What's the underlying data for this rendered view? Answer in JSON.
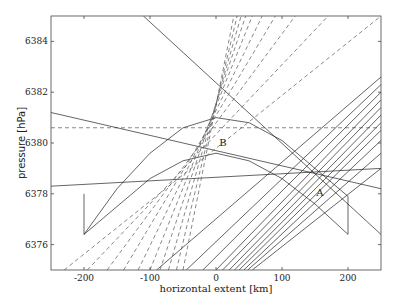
{
  "chart_data": {
    "type": "line",
    "title": "",
    "xlabel": "horizontal extent [km]",
    "ylabel": "pressure [hPa]",
    "xlim": [
      -250,
      250
    ],
    "ylim": [
      6375,
      6385
    ],
    "xticks": [
      -200,
      -100,
      0,
      100,
      200
    ],
    "xtick_labels": [
      "-200",
      "-100",
      "0",
      "100",
      "200"
    ],
    "yticks": [
      6376,
      6378,
      6380,
      6382,
      6384
    ],
    "ytick_labels": [
      "6376",
      "6378",
      "6380",
      "6382",
      "6384"
    ],
    "grid": false,
    "legend": null,
    "annotations": [
      {
        "text": "A",
        "x": 152,
        "y": 6377.9
      },
      {
        "text": "B",
        "x": 5,
        "y": 6379.9
      }
    ],
    "reference_lines": [
      {
        "name": "horizontal-dashed",
        "style": "dashed",
        "y": 6380.6
      }
    ],
    "arcs": [
      {
        "name": "outer-arc",
        "style": "solid",
        "points": [
          [
            -200,
            6378.0
          ],
          [
            -200,
            6376.4
          ],
          [
            -150,
            6378.2
          ],
          [
            -100,
            6379.6
          ],
          [
            -50,
            6380.6
          ],
          [
            0,
            6381.0
          ],
          [
            50,
            6380.8
          ],
          [
            100,
            6380.1
          ],
          [
            150,
            6379.0
          ],
          [
            200,
            6377.9
          ],
          [
            200,
            6376.4
          ]
        ]
      },
      {
        "name": "inner-arc",
        "style": "solid",
        "points": [
          [
            -200,
            6376.4
          ],
          [
            -150,
            6377.5
          ],
          [
            -100,
            6378.6
          ],
          [
            -50,
            6379.3
          ],
          [
            0,
            6379.6
          ],
          [
            50,
            6379.3
          ],
          [
            100,
            6378.6
          ],
          [
            150,
            6377.6
          ],
          [
            200,
            6376.4
          ]
        ]
      }
    ],
    "solid_lines": [
      {
        "name": "steep-descending",
        "p1": [
          -110,
          6385.0
        ],
        "p2": [
          250,
          6376.4
        ]
      },
      {
        "name": "shallow-descending",
        "p1": [
          -250,
          6381.2
        ],
        "p2": [
          250,
          6378.2
        ]
      },
      {
        "name": "near-horizontal",
        "p1": [
          -250,
          6378.3
        ],
        "p2": [
          250,
          6379.0
        ]
      }
    ],
    "series": [
      {
        "name": "rays-through-A",
        "style": "solid",
        "pivot": [
          150,
          6378.9
        ],
        "right_end_y": [
          6382.6,
          6382.3,
          6382.0,
          6381.7,
          6381.4,
          6381.1,
          6380.8,
          6380.5,
          6380.1,
          6379.6,
          6379.0
        ],
        "left_end_x_at_bottom": [
          -90,
          -45,
          -20,
          0,
          10,
          20,
          28,
          35,
          42,
          48,
          55
        ]
      },
      {
        "name": "rays-near-B",
        "style": "dashed",
        "bottom_x": [
          -230,
          -195,
          -165,
          -140,
          -118,
          -100,
          -85,
          -72,
          -60,
          -50
        ],
        "top_x": [
          250,
          170,
          120,
          90,
          70,
          55,
          45,
          38,
          32,
          27
        ]
      }
    ]
  }
}
